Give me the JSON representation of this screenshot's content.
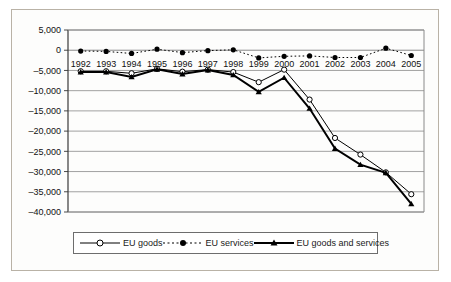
{
  "chart_data": {
    "type": "line",
    "title": "",
    "subtitle": "",
    "xlabel": "",
    "ylabel": "",
    "categories": [
      "1992",
      "1993",
      "1994",
      "1995",
      "1996",
      "1997",
      "1998",
      "1999",
      "2000",
      "2001",
      "2002",
      "2003",
      "2004",
      "2005"
    ],
    "x": [
      1992,
      1993,
      1994,
      1995,
      1996,
      1997,
      1998,
      1999,
      2000,
      2001,
      2002,
      2003,
      2004,
      2005
    ],
    "ylim": [
      -40000,
      5000
    ],
    "ytick_values": [
      5000,
      0,
      -5000,
      -10000,
      -15000,
      -20000,
      -25000,
      -30000,
      -35000,
      -40000
    ],
    "ytick_labels": [
      "5,000",
      "0",
      "–5,000",
      "–10,000",
      "–15,000",
      "–20,000",
      "–25,000",
      "–30,000",
      "–35,000",
      "–40,000"
    ],
    "grid": true,
    "grid_axis": "y",
    "legend_position": "bottom",
    "series": [
      {
        "name": "EU goods",
        "marker": "open-circle",
        "line_style": "solid",
        "line_width": 1,
        "color": "#000000",
        "values": [
          -5200,
          -5200,
          -5700,
          -4600,
          -5300,
          -4800,
          -5400,
          -7900,
          -4800,
          -12200,
          -21700,
          -25800,
          -30200,
          -35600
        ]
      },
      {
        "name": "EU services",
        "marker": "filled-circle",
        "line_style": "dotted",
        "line_width": 1,
        "color": "#000000",
        "values": [
          -200,
          -300,
          -800,
          250,
          -600,
          -100,
          100,
          -1900,
          -1500,
          -1400,
          -1800,
          -1800,
          500,
          -1300
        ]
      },
      {
        "name": "EU goods and services",
        "marker": "filled-triangle",
        "line_style": "solid",
        "line_width": 2,
        "color": "#000000",
        "values": [
          -5400,
          -5400,
          -6600,
          -4700,
          -5900,
          -4900,
          -6100,
          -10300,
          -6800,
          -14400,
          -24300,
          -28300,
          -30300,
          -38000
        ]
      }
    ]
  },
  "legend": {
    "items": [
      {
        "label": "EU goods",
        "marker": "open-circle",
        "style": "solid"
      },
      {
        "label": "EU services",
        "marker": "filled-circle",
        "style": "dotted"
      },
      {
        "label": "EU goods and services",
        "marker": "filled-triangle",
        "style": "thick-solid"
      }
    ]
  },
  "colors": {
    "ink": "#000000",
    "grid": "#8a8a8a",
    "axis": "#4a4a4a",
    "frame": "#b9b2a6"
  }
}
